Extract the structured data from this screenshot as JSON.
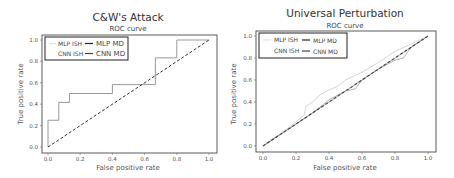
{
  "chart_data": [
    {
      "type": "line",
      "title": "C&W's Attack",
      "subtitle": "ROC curve",
      "xlabel": "False positive rate",
      "ylabel": "True positive rate",
      "xlim": [
        0,
        1
      ],
      "ylim": [
        0,
        1
      ],
      "xticks": [
        "0.0",
        "0.2",
        "0.4",
        "0.6",
        "0.8",
        "1.0"
      ],
      "yticks": [
        "0.0",
        "0.2",
        "0.4",
        "0.6",
        "0.8",
        "1.0"
      ],
      "grid": false,
      "legend_position": "upper left",
      "legend": [
        "MLP ISH",
        "MLP MD",
        "CNN ISH",
        "CNN MD"
      ],
      "series": [
        {
          "name": "ROC",
          "x": [
            0,
            0,
            0.067,
            0.067,
            0.133,
            0.133,
            0.4,
            0.4,
            0.667,
            0.667,
            0.8,
            0.8,
            1.0
          ],
          "y": [
            0,
            0.25,
            0.25,
            0.417,
            0.417,
            0.5,
            0.5,
            0.583,
            0.583,
            0.833,
            0.833,
            1.0,
            1.0
          ]
        },
        {
          "name": "Chance",
          "x": [
            0,
            1
          ],
          "y": [
            0,
            1
          ],
          "style": "dashed"
        }
      ]
    },
    {
      "type": "line",
      "title": "Universal Perturbation",
      "subtitle": "ROC curve",
      "xlabel": "False positive rate",
      "ylabel": "True positive rate",
      "xlim": [
        0,
        1
      ],
      "ylim": [
        0,
        1
      ],
      "xticks": [
        "0.0",
        "0.2",
        "0.4",
        "0.6",
        "0.8",
        "1.0"
      ],
      "yticks": [
        "0.0",
        "0.2",
        "0.4",
        "0.6",
        "0.8",
        "1.0"
      ],
      "grid": false,
      "legend_position": "upper left",
      "legend": [
        "MLP ISH",
        "MLP MD",
        "CNN ISH",
        "CNN MD"
      ],
      "series": [
        {
          "name": "MLP ISH",
          "x": [
            0,
            0.05,
            0.1,
            0.2,
            0.25,
            0.26,
            0.3,
            0.35,
            0.4,
            0.45,
            0.5,
            0.6,
            0.7,
            0.8,
            0.9,
            1.0
          ],
          "y": [
            0,
            0.06,
            0.1,
            0.22,
            0.28,
            0.36,
            0.4,
            0.47,
            0.51,
            0.54,
            0.6,
            0.67,
            0.76,
            0.86,
            0.93,
            1.0
          ]
        },
        {
          "name": "CNN ISH",
          "x": [
            0,
            0.1,
            0.2,
            0.3,
            0.4,
            0.5,
            0.56,
            0.6,
            0.7,
            0.8,
            0.85,
            0.9,
            1.0
          ],
          "y": [
            0,
            0.1,
            0.2,
            0.3,
            0.42,
            0.5,
            0.52,
            0.6,
            0.7,
            0.78,
            0.8,
            0.9,
            1.0
          ]
        },
        {
          "name": "MLP MD",
          "x": [
            0,
            1
          ],
          "y": [
            0,
            1
          ],
          "style": "dashed"
        },
        {
          "name": "CNN MD",
          "x": [
            0,
            1
          ],
          "y": [
            0,
            1
          ],
          "style": "dashed"
        }
      ]
    }
  ],
  "colors": {
    "axes": "#333333",
    "roc_line": "#999999",
    "ish_light": "#c8c8c8",
    "diag": "#333333"
  }
}
